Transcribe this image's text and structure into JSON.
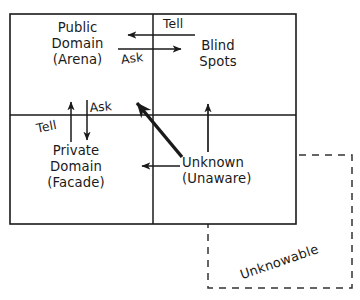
{
  "diagram": {
    "type": "johari-window",
    "title": "",
    "colors": {
      "stroke": "#1a1a1a",
      "text": "#1a1a1a",
      "background": "#ffffff",
      "dashed_stroke": "#333333"
    },
    "quadrants": [
      {
        "id": "public-domain",
        "position": "top-left",
        "lines": [
          "Public",
          "Domain",
          "(Arena)"
        ]
      },
      {
        "id": "blind-spots",
        "position": "top-right",
        "lines": [
          "Blind",
          "Spots"
        ]
      },
      {
        "id": "private-domain",
        "position": "bottom-left",
        "lines": [
          "Private",
          "Domain",
          "(Facade)"
        ]
      },
      {
        "id": "unknown",
        "position": "bottom-right",
        "lines": [
          "Unknown",
          "(Unaware)"
        ]
      }
    ],
    "outer_region": {
      "id": "unknowable",
      "label": "Unknowable",
      "style": "dashed",
      "rotation_deg": -19
    },
    "flow_labels": [
      {
        "id": "tell-top",
        "text": "Tell",
        "direction": "left",
        "rotation_deg": 0
      },
      {
        "id": "ask-mid",
        "text": "Ask",
        "direction": "right",
        "rotation_deg": -7
      },
      {
        "id": "ask-left",
        "text": "Ask",
        "direction": "down",
        "rotation_deg": -5
      },
      {
        "id": "tell-left",
        "text": "Tell",
        "direction": "up",
        "rotation_deg": -11
      }
    ],
    "arrows": [
      {
        "id": "arrow-tell-top",
        "from": [
          195,
          35
        ],
        "to": [
          126,
          35
        ],
        "weight": "thin"
      },
      {
        "id": "arrow-ask-mid",
        "from": [
          118,
          49
        ],
        "to": [
          183,
          49
        ],
        "weight": "thin"
      },
      {
        "id": "arrow-tell-up",
        "from": [
          71,
          140
        ],
        "to": [
          71,
          100
        ],
        "weight": "thin"
      },
      {
        "id": "arrow-ask-down",
        "from": [
          87,
          100
        ],
        "to": [
          87,
          140
        ],
        "weight": "thin"
      },
      {
        "id": "arrow-unknown-blind",
        "from": [
          208,
          150
        ],
        "to": [
          208,
          103
        ],
        "weight": "thin"
      },
      {
        "id": "arrow-unknown-private",
        "from": [
          180,
          166
        ],
        "to": [
          140,
          166
        ],
        "weight": "thin"
      },
      {
        "id": "arrow-unknown-public",
        "from": [
          182,
          157
        ],
        "to": [
          133,
          99
        ],
        "weight": "thick"
      }
    ]
  }
}
